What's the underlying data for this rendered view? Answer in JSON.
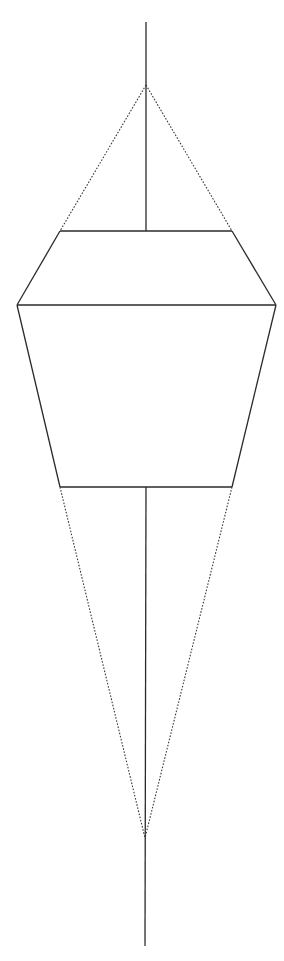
{
  "canvas": {
    "width": 284,
    "height": 961,
    "background": "#ffffff"
  },
  "colors": {
    "solid": "#2a2a2a",
    "dotted": "#3a3a3a"
  },
  "diagram": {
    "axis": {
      "top": {
        "x": 146,
        "y": 22
      },
      "upper_apex": {
        "x": 146,
        "y": 85
      },
      "upper_join": {
        "x": 146,
        "y": 231
      },
      "lower_join": {
        "x": 146,
        "y": 487
      },
      "lower_apex": {
        "x": 145,
        "y": 838
      },
      "bottom": {
        "x": 145,
        "y": 946
      }
    },
    "body": {
      "top_left": {
        "x": 60,
        "y": 231
      },
      "top_right": {
        "x": 232,
        "y": 231
      },
      "mid_left": {
        "x": 17,
        "y": 305
      },
      "mid_right": {
        "x": 276,
        "y": 305
      },
      "bottom_left": {
        "x": 60,
        "y": 487
      },
      "bottom_right": {
        "x": 232,
        "y": 487
      }
    },
    "solid_segments": [
      {
        "name": "axis-upper-line",
        "x1": 146,
        "y1": 22,
        "x2": 146,
        "y2": 231
      },
      {
        "name": "body-top-edge",
        "x1": 60,
        "y1": 231,
        "x2": 232,
        "y2": 231
      },
      {
        "name": "body-upper-left-edge",
        "x1": 60,
        "y1": 231,
        "x2": 17,
        "y2": 305
      },
      {
        "name": "body-upper-right-edge",
        "x1": 232,
        "y1": 231,
        "x2": 276,
        "y2": 305
      },
      {
        "name": "body-middle-edge",
        "x1": 17,
        "y1": 305,
        "x2": 276,
        "y2": 305
      },
      {
        "name": "body-lower-left-edge",
        "x1": 17,
        "y1": 305,
        "x2": 60,
        "y2": 487
      },
      {
        "name": "body-lower-right-edge",
        "x1": 276,
        "y1": 305,
        "x2": 232,
        "y2": 487
      },
      {
        "name": "body-bottom-edge",
        "x1": 60,
        "y1": 487,
        "x2": 232,
        "y2": 487
      },
      {
        "name": "axis-lower-line",
        "x1": 146,
        "y1": 487,
        "x2": 145,
        "y2": 946
      }
    ],
    "dotted_segments": [
      {
        "name": "upper-left-projection",
        "x1": 146,
        "y1": 85,
        "x2": 60,
        "y2": 231
      },
      {
        "name": "upper-right-projection",
        "x1": 146,
        "y1": 85,
        "x2": 232,
        "y2": 231
      },
      {
        "name": "lower-left-projection",
        "x1": 60,
        "y1": 487,
        "x2": 145,
        "y2": 838
      },
      {
        "name": "lower-right-projection",
        "x1": 232,
        "y1": 487,
        "x2": 145,
        "y2": 838
      }
    ]
  }
}
